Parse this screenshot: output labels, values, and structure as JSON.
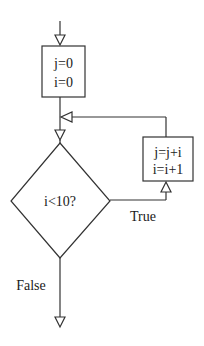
{
  "diagram": {
    "type": "flowchart",
    "colors": {
      "stroke": "#333333",
      "text": "#1a1a1a",
      "background": "#ffffff"
    },
    "nodes": {
      "init": {
        "shape": "rectangle",
        "lines": [
          "j=0",
          "i=0"
        ]
      },
      "condition": {
        "shape": "diamond",
        "label": "i<10?"
      },
      "body": {
        "shape": "rectangle",
        "lines": [
          "j=j+i",
          "i=i+1"
        ]
      }
    },
    "edges": {
      "true_label": "True",
      "false_label": "False"
    }
  }
}
